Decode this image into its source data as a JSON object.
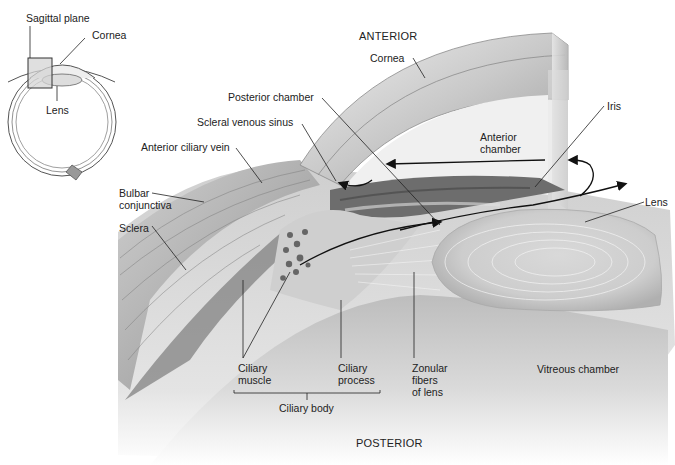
{
  "diagram": {
    "title_direction_top": "ANTERIOR",
    "title_direction_bottom": "POSTERIOR",
    "colors": {
      "background": "#ffffff",
      "tissue_dark": "#6e6e6e",
      "tissue_mid": "#a8a8a8",
      "tissue_light": "#d6d6d6",
      "leader_line": "#222222",
      "label_text": "#222222"
    },
    "inset": {
      "labels": {
        "sagittal_plane": "Sagittal plane",
        "cornea": "Cornea",
        "lens": "Lens"
      }
    },
    "labels": {
      "cornea": "Cornea",
      "posterior_chamber": "Posterior chamber",
      "scleral_venous_sinus": "Scleral venous sinus",
      "anterior_ciliary_vein": "Anterior ciliary vein",
      "bulbar_conjunctiva": "Bulbar\nconjunctiva",
      "sclera": "Sclera",
      "iris": "Iris",
      "anterior_chamber": "Anterior\nchamber",
      "lens": "Lens",
      "ciliary_muscle": "Ciliary\nmuscle",
      "ciliary_process": "Ciliary\nprocess",
      "ciliary_body": "Ciliary body",
      "zonular_fibers": "Zonular\nfibers\nof lens",
      "vitreous_chamber": "Vitreous chamber"
    }
  }
}
